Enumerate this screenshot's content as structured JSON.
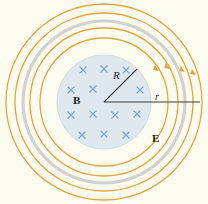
{
  "figure": {
    "name": "induced-electric-field-diagram",
    "background_color": "#fdfcf1",
    "width": 208,
    "height": 204
  },
  "labels": {
    "magnetic_field": "B",
    "electric_field": "E",
    "disk_radius": "R",
    "field_radius": "r"
  },
  "colors": {
    "field_line": "#e8a53a",
    "field_line_light": "#f0c069",
    "shadow_ring": "#c7c7c7",
    "disk_fill": "#dfe8ef",
    "disk_edge": "#cfdae3",
    "cross_mark": "#7fa8cf",
    "radius_line": "#3a3a3a",
    "text": "#1b1b1b"
  },
  "geometry": {
    "center": {
      "x": 104,
      "y": 102
    },
    "disk_radius_px": 47,
    "field_circle_radii_px": [
      64,
      74,
      89,
      98
    ],
    "shadow_circle_radius_px": 81,
    "radius_line_angle_deg": 45,
    "r_line_length_px": 104
  },
  "cross_marks": {
    "symbol": "×",
    "count": 17,
    "positions": [
      {
        "x": 83,
        "y": 70
      },
      {
        "x": 104,
        "y": 69
      },
      {
        "x": 126,
        "y": 70
      },
      {
        "x": 71,
        "y": 90
      },
      {
        "x": 93,
        "y": 89
      },
      {
        "x": 140,
        "y": 90
      },
      {
        "x": 71,
        "y": 115
      },
      {
        "x": 93,
        "y": 114
      },
      {
        "x": 115,
        "y": 115
      },
      {
        "x": 137,
        "y": 114
      },
      {
        "x": 82,
        "y": 135
      },
      {
        "x": 104,
        "y": 134
      },
      {
        "x": 126,
        "y": 135
      },
      {
        "x": 104,
        "y": 51
      },
      {
        "x": 60,
        "y": 102
      },
      {
        "x": 148,
        "y": 102
      },
      {
        "x": 104,
        "y": 152
      }
    ]
  },
  "arrowheads": {
    "description": "direction markers on electric field lines",
    "count": 4,
    "positions": [
      {
        "x": 156,
        "y": 69
      },
      {
        "x": 167,
        "y": 67
      },
      {
        "x": 182,
        "y": 70
      },
      {
        "x": 193,
        "y": 72
      }
    ]
  }
}
